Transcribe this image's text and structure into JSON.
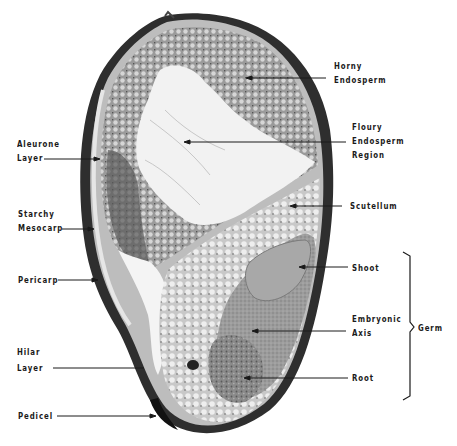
{
  "figure": {
    "colors": {
      "background": "#ffffff",
      "ink": "#1a1a1a",
      "tissue_dark": "#3a3a3a",
      "tissue_mid": "#8c8c8c",
      "tissue_light": "#e8e8e8"
    }
  },
  "labels": {
    "horny_endosperm": {
      "line1": "Horny",
      "line2": "Endosperm"
    },
    "floury_endosperm": {
      "line1": "Floury",
      "line2": "Endosperm",
      "line3": "Region"
    },
    "aleurone": {
      "line1": "Aleurone",
      "line2": "Layer"
    },
    "starchy_mesocarp": {
      "line1": "Starchy",
      "line2": "Mesocarp"
    },
    "scutellum": {
      "line1": "Scutellum"
    },
    "pericarp": {
      "line1": "Pericarp"
    },
    "shoot": {
      "line1": "Shoot"
    },
    "embryonic_axis": {
      "line1": "Embryonic",
      "line2": "Axis"
    },
    "germ": {
      "line1": "Germ"
    },
    "hilar_layer": {
      "line1": "Hilar",
      "line2": "Layer"
    },
    "root": {
      "line1": "Root"
    },
    "pedicel": {
      "line1": "Pedicel"
    }
  }
}
